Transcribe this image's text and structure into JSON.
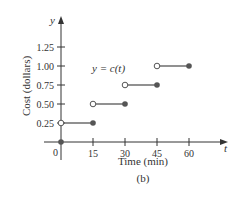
{
  "chart_data": {
    "type": "line",
    "subtype": "step-function",
    "title": "",
    "caption": "(b)",
    "xlabel": "Time (min)",
    "ylabel": "Cost (dollars)",
    "x_axis_symbol": "t",
    "y_axis_symbol": "y",
    "function_label": "y = c(t)",
    "x_ticks": [
      15,
      30,
      45,
      60
    ],
    "x_origin_label": "0",
    "y_ticks": [
      0.25,
      0.5,
      0.75,
      1.0,
      1.25
    ],
    "y_tick_labels": [
      "0.25",
      "0.50",
      "0.75",
      "1.00",
      "1.25"
    ],
    "xlim": [
      0,
      70
    ],
    "ylim": [
      0,
      1.4
    ],
    "grid": false,
    "legend": "none",
    "point_at_origin": {
      "t": 0,
      "y": 0,
      "filled": true
    },
    "segments": [
      {
        "t_start": 0,
        "t_end": 15,
        "value": 0.25,
        "start_open": true,
        "end_filled": true
      },
      {
        "t_start": 15,
        "t_end": 30,
        "value": 0.5,
        "start_open": true,
        "end_filled": true
      },
      {
        "t_start": 30,
        "t_end": 45,
        "value": 0.75,
        "start_open": true,
        "end_filled": true
      },
      {
        "t_start": 45,
        "t_end": 60,
        "value": 1.0,
        "start_open": true,
        "end_filled": true
      }
    ],
    "colors": {
      "line": "#555555",
      "axis": "#333333",
      "text": "#333333"
    }
  }
}
